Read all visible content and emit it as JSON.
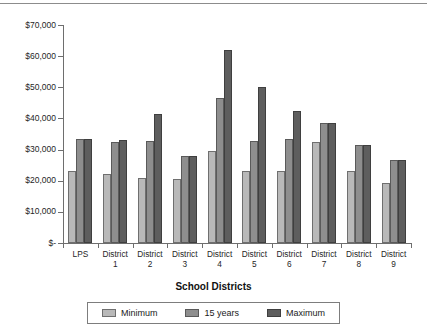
{
  "chart_data": {
    "type": "bar",
    "title": "",
    "xlabel": "School Districts",
    "ylabel": "",
    "ylim": [
      0,
      70000
    ],
    "ytick_values": [
      0,
      10000,
      20000,
      30000,
      40000,
      50000,
      60000,
      70000
    ],
    "ytick_labels": [
      "$-",
      "$10,000",
      "$20,000",
      "$30,000",
      "$40,000",
      "$50,000",
      "$60,000",
      "$70,000"
    ],
    "grid": false,
    "legend_position": "bottom",
    "categories": [
      "LPS",
      "District 1",
      "District 2",
      "District 3",
      "District 4",
      "District 5",
      "District 6",
      "District 7",
      "District 8",
      "District 9"
    ],
    "category_lines": [
      [
        "LPS",
        ""
      ],
      [
        "District",
        "1"
      ],
      [
        "District",
        "2"
      ],
      [
        "District",
        "3"
      ],
      [
        "District",
        "4"
      ],
      [
        "District",
        "5"
      ],
      [
        "District",
        "6"
      ],
      [
        "District",
        "7"
      ],
      [
        "District",
        "8"
      ],
      [
        "District",
        "9"
      ]
    ],
    "series": [
      {
        "name": "Minimum",
        "color": "#b9b9b9",
        "values": [
          23000,
          22200,
          21000,
          20400,
          29700,
          23000,
          23200,
          32500,
          23000,
          19300
        ]
      },
      {
        "name": "15 years",
        "color": "#8e8e8e",
        "values": [
          33400,
          32500,
          32800,
          28000,
          46600,
          32700,
          33300,
          38500,
          31400,
          26500
        ]
      },
      {
        "name": "Maximum",
        "color": "#5e5e5e",
        "values": [
          33400,
          33000,
          41500,
          28000,
          62000,
          50000,
          42300,
          38500,
          31400,
          26500
        ]
      }
    ]
  },
  "colors": {
    "minimum": "#b9b9b9",
    "fifteen_years": "#8e8e8e",
    "maximum": "#5e5e5e",
    "axis": "#6e6e6e",
    "background": "#ffffff"
  }
}
